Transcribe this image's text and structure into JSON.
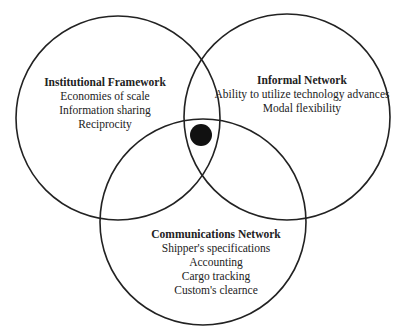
{
  "diagram": {
    "type": "venn",
    "circles": [
      {
        "id": "institutional",
        "title": "Institutional Framework",
        "items": [
          "Economies of scale",
          "Information sharing",
          "Reciprocity"
        ],
        "cx": 118,
        "cy": 118,
        "r": 102
      },
      {
        "id": "informal",
        "title": "Informal Network",
        "items": [
          "Ability to utilize technology advances",
          "Modal flexibility"
        ],
        "cx": 287,
        "cy": 117,
        "r": 103
      },
      {
        "id": "communications",
        "title": "Communications Network",
        "items": [
          "Shipper's specifications",
          "Accounting",
          "Cargo tracking",
          "Custom's clearnce"
        ],
        "cx": 203,
        "cy": 222,
        "r": 103
      }
    ],
    "center_dot": {
      "cx": 201,
      "cy": 135,
      "r": 11,
      "color": "#111111"
    },
    "stroke_color": "#222222"
  }
}
